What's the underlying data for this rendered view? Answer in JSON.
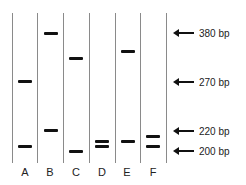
{
  "gel": {
    "lanes": [
      {
        "label": "A",
        "bands_bp": [
          270,
          210
        ]
      },
      {
        "label": "B",
        "bands_bp": [
          380,
          220
        ]
      },
      {
        "label": "C",
        "bands_bp": [
          320,
          200
        ]
      },
      {
        "label": "D",
        "bands_bp": [
          208,
          203
        ]
      },
      {
        "label": "E",
        "bands_bp": [
          340,
          208
        ]
      },
      {
        "label": "F",
        "bands_bp": [
          214,
          205
        ]
      }
    ],
    "markers": [
      {
        "label": "380 bp",
        "bp": 380
      },
      {
        "label": "270 bp",
        "bp": 270
      },
      {
        "label": "220 bp",
        "bp": 220
      },
      {
        "label": "200 bp",
        "bp": 200
      }
    ],
    "band_color": "#111111",
    "line_color": "#8a8a8a"
  }
}
